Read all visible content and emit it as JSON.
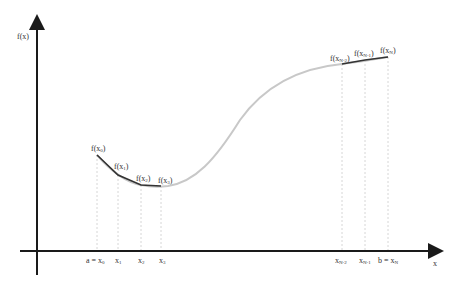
{
  "diagram": {
    "axes": {
      "y_label": "f(x)",
      "x_label": "x",
      "colors": {
        "axis": "#1a1a1a",
        "curve": "#c8c8c8",
        "segments": "#333333",
        "guides": "#cccccc"
      }
    },
    "x_ticks": [
      {
        "label": "a = x",
        "sub": "0",
        "x": 97
      },
      {
        "label": "x",
        "sub": "1",
        "x": 118
      },
      {
        "label": "x",
        "sub": "2",
        "x": 141
      },
      {
        "label": "x",
        "sub": "3",
        "x": 161
      },
      {
        "label": "x",
        "sub": "N-2",
        "x": 342
      },
      {
        "label": "x",
        "sub": "N-1",
        "x": 365
      },
      {
        "label": "b = x",
        "sub": "N",
        "x": 388
      }
    ],
    "points": [
      {
        "label": "f(x",
        "sub": "0",
        "x": 97,
        "y": 155
      },
      {
        "label": "f(x",
        "sub": "1",
        "x": 118,
        "y": 175
      },
      {
        "label": "f(x",
        "sub": "2",
        "x": 141,
        "y": 185
      },
      {
        "label": "f(x",
        "sub": "3",
        "x": 161,
        "y": 186
      },
      {
        "label": "f(x",
        "sub": "N-2",
        "x": 342,
        "y": 64
      },
      {
        "label": "f(x",
        "sub": "N-1",
        "x": 365,
        "y": 60
      },
      {
        "label": "f(x",
        "sub": "N",
        "x": 388,
        "y": 57
      }
    ]
  }
}
